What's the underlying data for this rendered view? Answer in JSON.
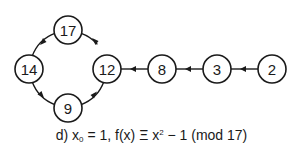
{
  "diagram": {
    "nodes": [
      {
        "id": "n17",
        "label": "17",
        "x": 68,
        "y": 30
      },
      {
        "id": "n14",
        "label": "14",
        "x": 29,
        "y": 69
      },
      {
        "id": "n9",
        "label": "9",
        "x": 68,
        "y": 108
      },
      {
        "id": "n12",
        "label": "12",
        "x": 107,
        "y": 69
      },
      {
        "id": "n8",
        "label": "8",
        "x": 162,
        "y": 69
      },
      {
        "id": "n3",
        "label": "3",
        "x": 217,
        "y": 69
      },
      {
        "id": "n2",
        "label": "2",
        "x": 272,
        "y": 69
      }
    ],
    "edges": [
      {
        "from": "2",
        "to": "3"
      },
      {
        "from": "3",
        "to": "8"
      },
      {
        "from": "8",
        "to": "12"
      },
      {
        "from": "12",
        "to": "17"
      },
      {
        "from": "17",
        "to": "14"
      },
      {
        "from": "14",
        "to": "9"
      },
      {
        "from": "9",
        "to": "12"
      }
    ],
    "node_radius": 14,
    "stroke_color": "#1a1a1a"
  },
  "caption": {
    "prefix": "d) x",
    "sub": "0",
    "mid": " = 1,  f(x) Ξ x",
    "sup": "2",
    "suffix": " − 1 (mod 17)"
  }
}
